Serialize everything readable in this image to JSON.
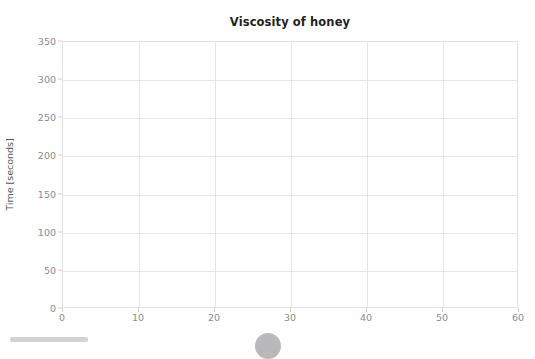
{
  "chart_data": {
    "type": "scatter",
    "title": "Viscosity of honey",
    "xlabel": "",
    "ylabel": "Time [seconds]",
    "xlim": [
      0,
      60
    ],
    "ylim": [
      0,
      350
    ],
    "x_ticks": [
      0,
      10,
      20,
      30,
      40,
      50,
      60
    ],
    "y_ticks": [
      0,
      50,
      100,
      150,
      200,
      250,
      300,
      350
    ],
    "grid": true,
    "legend": null,
    "series": [],
    "x": [],
    "values": [],
    "annotations": []
  },
  "colors": {
    "title_text": "#231f20",
    "tick_text": "#8a8a8e",
    "axis_title_text": "#55555a",
    "gridline": "#e6e6e8",
    "plot_border": "#e2e2e4",
    "background": "#ffffff",
    "scrollbar_thumb": "#d2d2d4",
    "fab": "#b9b9bc"
  },
  "chrome": {
    "scrollbar_name": "horizontal-scrollbar",
    "fab_name": "floating-action-button"
  }
}
